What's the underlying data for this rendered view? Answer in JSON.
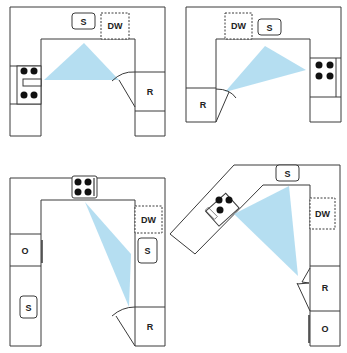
{
  "diagram": {
    "colors": {
      "line": "#3a3a3a",
      "triangle_fill": "#a8d8ee",
      "burner": "#111111",
      "background": "#ffffff"
    },
    "legend_labels": {
      "sink": "S",
      "dishwasher": "DW",
      "refrigerator": "R",
      "oven": "O"
    },
    "layouts": [
      {
        "name": "u-shape-top-left",
        "labels": {
          "sink": "S",
          "dishwasher": "DW",
          "refrigerator": "R"
        },
        "cooktop_burners": 4
      },
      {
        "name": "u-shape-top-right",
        "labels": {
          "sink": "S",
          "dishwasher": "DW",
          "refrigerator": "R"
        },
        "cooktop_burners": 4
      },
      {
        "name": "u-shape-bottom-left",
        "labels": {
          "sink_right": "S",
          "sink_left": "S",
          "dishwasher": "DW",
          "refrigerator": "R",
          "oven": "O"
        },
        "cooktop_burners": 4
      },
      {
        "name": "angled-bottom-right",
        "labels": {
          "sink": "S",
          "dishwasher": "DW",
          "refrigerator": "R",
          "oven": "O"
        },
        "cooktop_burners": 3
      }
    ]
  }
}
